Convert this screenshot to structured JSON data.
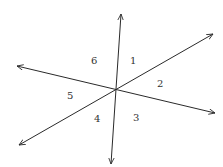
{
  "diagram": {
    "type": "intersecting-lines",
    "center": [
      115,
      89
    ],
    "lines": [
      {
        "name": "vertical-line",
        "from": [
          111,
          164
        ],
        "to": [
          121,
          14
        ]
      },
      {
        "name": "descending-line",
        "from": [
          17,
          66
        ],
        "to": [
          215,
          113
        ]
      },
      {
        "name": "ascending-line",
        "from": [
          19,
          145
        ],
        "to": [
          213,
          34
        ]
      }
    ],
    "angles": [
      {
        "label": "1",
        "pos": [
          133,
          64
        ]
      },
      {
        "label": "2",
        "pos": [
          160,
          87
        ]
      },
      {
        "label": "3",
        "pos": [
          136,
          120
        ]
      },
      {
        "label": "4",
        "pos": [
          97,
          121
        ]
      },
      {
        "label": "5",
        "pos": [
          70,
          98
        ]
      },
      {
        "label": "6",
        "pos": [
          94,
          64
        ]
      }
    ],
    "colors": {
      "line": "#2a2a2a",
      "text": "#333333",
      "background": "#ffffff"
    }
  }
}
